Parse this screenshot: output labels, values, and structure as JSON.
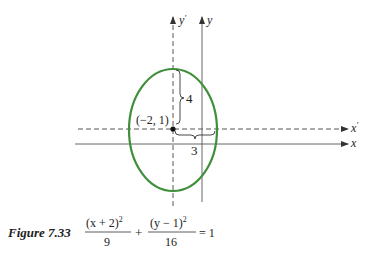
{
  "figure": {
    "caption_label": "Figure 7.33",
    "equation": {
      "term1_numerator": "(x + 2)",
      "term1_exponent": "2",
      "term1_denominator": "9",
      "plus": "+",
      "term2_numerator": "(y − 1)",
      "term2_exponent": "2",
      "term2_denominator": "16",
      "equals": "= 1"
    }
  },
  "axes": {
    "x_label": "x",
    "y_label": "y",
    "x_prime_label": "x",
    "y_prime_label": "y",
    "prime_mark": "′"
  },
  "ellipse": {
    "center": {
      "x": -2,
      "y": 1
    },
    "center_label": "(−2, 1)",
    "semi_axis_horizontal": 3,
    "semi_axis_vertical": 4,
    "horizontal_label": "3",
    "vertical_label": "4",
    "stroke_color": "#3f8f3a"
  },
  "colors": {
    "axis": "#444444",
    "text": "#222222"
  }
}
